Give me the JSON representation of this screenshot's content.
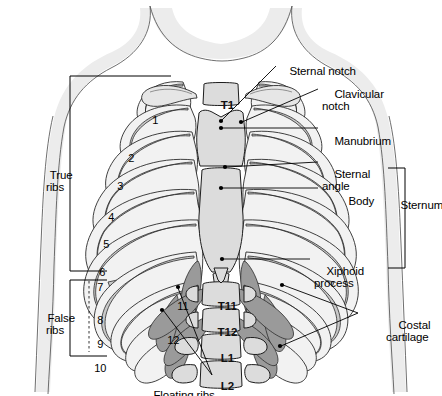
{
  "figure": {
    "width": 442,
    "height": 396,
    "background": "#ffffff",
    "ink": "#000000",
    "bone_fill": "#f0f0f0",
    "bone_shade": "#d0d0d0",
    "cartilage_fill": "#9e9e9e",
    "body_outline": "#d9d9d9"
  },
  "labels": {
    "true_ribs": "True\nribs",
    "false_ribs": "False\nribs",
    "sternal_notch": "Sternal notch",
    "clavicular_notch": "Clavicular\nnotch",
    "manubrium": "Manubrium",
    "sternal_angle": "Sternal\nangle",
    "body": "Body",
    "sternum": "Sternum",
    "xiphoid_process": "Xiphoid\nprocess",
    "costal_cartilage": "Costal\ncartilage",
    "floating_ribs": "Floating ribs"
  },
  "rib_numbers": [
    "1",
    "2",
    "3",
    "4",
    "5",
    "6",
    "7",
    "8",
    "9",
    "10",
    "11",
    "12"
  ],
  "vertebrae": [
    {
      "label": "T1"
    },
    {
      "label": "T11"
    },
    {
      "label": "T12"
    },
    {
      "label": "L1"
    },
    {
      "label": "L2"
    }
  ],
  "brackets": [
    {
      "name": "true-ribs-bracket",
      "label": "True\nribs"
    },
    {
      "name": "false-ribs-bracket",
      "label": "False\nribs"
    },
    {
      "name": "sternum-bracket",
      "label": "Sternum"
    }
  ]
}
